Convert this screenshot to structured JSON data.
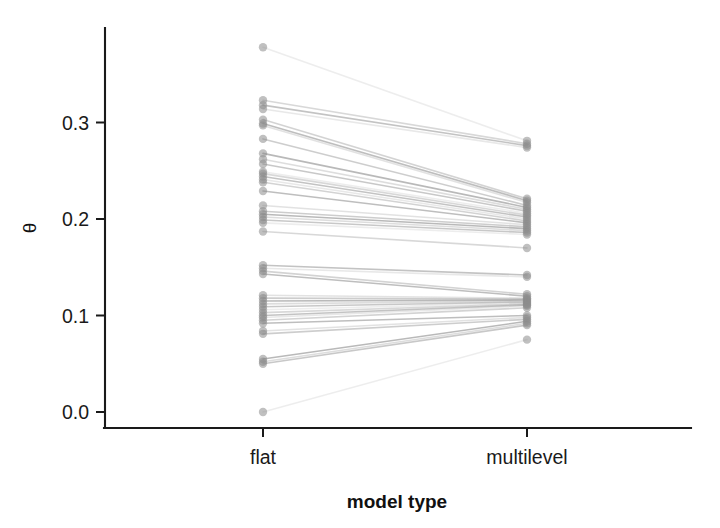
{
  "figure": {
    "background_color": "#ffffff",
    "ink_color": "#1a1a1a",
    "series_color": "#8c8c8c"
  },
  "axis": {
    "y_title": "θ",
    "x_title": "model type",
    "y_ticks": [
      "0.0",
      "0.1",
      "0.2",
      "0.3"
    ],
    "x_ticks": [
      "flat",
      "multilevel"
    ]
  },
  "chart_data": {
    "type": "line",
    "subtype": "slopegraph",
    "title": "",
    "subtitle": "",
    "xlabel": "model type",
    "ylabel": "θ",
    "categories": [
      "flat",
      "multilevel"
    ],
    "x": [
      0,
      1
    ],
    "xtick_labels": [
      "flat",
      "multilevel"
    ],
    "ytick_labels": [
      "0.0",
      "0.1",
      "0.2",
      "0.3"
    ],
    "ytick_values": [
      0.0,
      0.1,
      0.2,
      0.3
    ],
    "ylim": [
      -0.012,
      0.412
    ],
    "xlim": [
      -0.55,
      1.55
    ],
    "grid": false,
    "legend": "none",
    "point_color": "#8c8c8c",
    "point_opacity": 0.55,
    "point_radius": 4.2,
    "line_color": "#8c8c8c",
    "line_width": 1.6,
    "n_pairs": 45,
    "annotations": [],
    "series": [
      {
        "name": "pair-01",
        "values": [
          0.378,
          0.281
        ]
      },
      {
        "name": "pair-02",
        "values": [
          0.323,
          0.278
        ]
      },
      {
        "name": "pair-03",
        "values": [
          0.318,
          0.276
        ]
      },
      {
        "name": "pair-04",
        "values": [
          0.314,
          0.274
        ]
      },
      {
        "name": "pair-05",
        "values": [
          0.303,
          0.221
        ]
      },
      {
        "name": "pair-06",
        "values": [
          0.299,
          0.219
        ]
      },
      {
        "name": "pair-07",
        "values": [
          0.297,
          0.217
        ]
      },
      {
        "name": "pair-08",
        "values": [
          0.283,
          0.214
        ]
      },
      {
        "name": "pair-09",
        "values": [
          0.268,
          0.212
        ]
      },
      {
        "name": "pair-10",
        "values": [
          0.262,
          0.21
        ]
      },
      {
        "name": "pair-11",
        "values": [
          0.257,
          0.208
        ]
      },
      {
        "name": "pair-12",
        "values": [
          0.249,
          0.206
        ]
      },
      {
        "name": "pair-13",
        "values": [
          0.247,
          0.204
        ]
      },
      {
        "name": "pair-14",
        "values": [
          0.244,
          0.202
        ]
      },
      {
        "name": "pair-15",
        "values": [
          0.241,
          0.2
        ]
      },
      {
        "name": "pair-16",
        "values": [
          0.238,
          0.198
        ]
      },
      {
        "name": "pair-17",
        "values": [
          0.229,
          0.196
        ]
      },
      {
        "name": "pair-18",
        "values": [
          0.214,
          0.194
        ]
      },
      {
        "name": "pair-19",
        "values": [
          0.208,
          0.192
        ]
      },
      {
        "name": "pair-20",
        "values": [
          0.205,
          0.19
        ]
      },
      {
        "name": "pair-21",
        "values": [
          0.202,
          0.188
        ]
      },
      {
        "name": "pair-22",
        "values": [
          0.199,
          0.186
        ]
      },
      {
        "name": "pair-23",
        "values": [
          0.196,
          0.184
        ]
      },
      {
        "name": "pair-24",
        "values": [
          0.187,
          0.17
        ]
      },
      {
        "name": "pair-25",
        "values": [
          0.152,
          0.142
        ]
      },
      {
        "name": "pair-26",
        "values": [
          0.149,
          0.14
        ]
      },
      {
        "name": "pair-27",
        "values": [
          0.146,
          0.122
        ]
      },
      {
        "name": "pair-28",
        "values": [
          0.143,
          0.12
        ]
      },
      {
        "name": "pair-29",
        "values": [
          0.121,
          0.118
        ]
      },
      {
        "name": "pair-30",
        "values": [
          0.118,
          0.117
        ]
      },
      {
        "name": "pair-31",
        "values": [
          0.115,
          0.116
        ]
      },
      {
        "name": "pair-32",
        "values": [
          0.112,
          0.115
        ]
      },
      {
        "name": "pair-33",
        "values": [
          0.109,
          0.114
        ]
      },
      {
        "name": "pair-34",
        "values": [
          0.106,
          0.113
        ]
      },
      {
        "name": "pair-35",
        "values": [
          0.103,
          0.112
        ]
      },
      {
        "name": "pair-36",
        "values": [
          0.1,
          0.111
        ]
      },
      {
        "name": "pair-37",
        "values": [
          0.098,
          0.11
        ]
      },
      {
        "name": "pair-38",
        "values": [
          0.095,
          0.108
        ]
      },
      {
        "name": "pair-39",
        "values": [
          0.092,
          0.1
        ]
      },
      {
        "name": "pair-40",
        "values": [
          0.084,
          0.098
        ]
      },
      {
        "name": "pair-41",
        "values": [
          0.081,
          0.096
        ]
      },
      {
        "name": "pair-42",
        "values": [
          0.055,
          0.094
        ]
      },
      {
        "name": "pair-43",
        "values": [
          0.052,
          0.092
        ]
      },
      {
        "name": "pair-44",
        "values": [
          0.05,
          0.09
        ]
      },
      {
        "name": "pair-45",
        "values": [
          0.0,
          0.075
        ]
      }
    ]
  }
}
